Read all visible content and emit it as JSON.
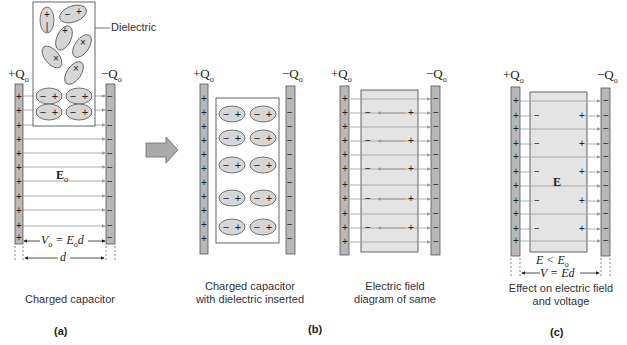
{
  "figure": {
    "panels": [
      {
        "id": "a",
        "label": "(a)",
        "caption": "Charged capacitor",
        "plate_left_charge": "+Q",
        "plate_right_charge": "−Q",
        "charge_subscript": "o",
        "dielectric_label": "Dielectric",
        "field_label": "E",
        "field_subscript": "o",
        "voltage_label": "V",
        "voltage_expr": "= E",
        "voltage_tail": "d",
        "distance_label": "d"
      },
      {
        "id": "b1",
        "label": "(b)",
        "caption": "Charged capacitor\nwith dielectric inserted",
        "plate_left_charge": "+Q",
        "plate_right_charge": "−Q",
        "charge_subscript": "o"
      },
      {
        "id": "b2",
        "caption": "Electric field\ndiagram of same",
        "plate_left_charge": "+Q",
        "plate_right_charge": "−Q",
        "charge_subscript": "o"
      },
      {
        "id": "c",
        "label": "(c)",
        "caption": "Effect on electric field\nand voltage",
        "plate_left_charge": "+Q",
        "plate_right_charge": "−Q",
        "charge_subscript": "o",
        "field_label": "E",
        "inequality": "E < E",
        "inequality_subscript": "o",
        "voltage_expr": "V = Ed"
      }
    ],
    "colors": {
      "plate_fill": "#b8b8b8",
      "dielectric_fill": "#e4e4e4",
      "molecule_fill": "#d6d6d6",
      "line": "#555555",
      "field_line": "#9a9a9a",
      "arrow_fill": "#aaaaaa"
    },
    "symbols": {
      "plus": "+",
      "minus": "−"
    }
  }
}
